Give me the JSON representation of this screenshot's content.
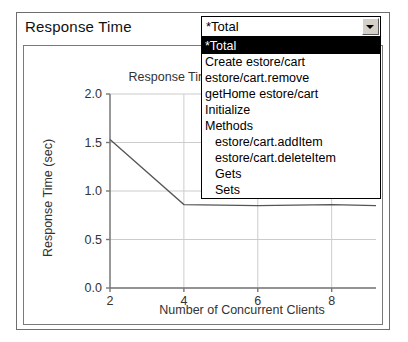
{
  "panel": {
    "title": "Response Time"
  },
  "combo": {
    "value": "*Total",
    "arrow_icon": "chevron-down-icon",
    "options": [
      {
        "label": "*Total",
        "selected": true,
        "indent": false
      },
      {
        "label": "Create estore/cart",
        "selected": false,
        "indent": false
      },
      {
        "label": "estore/cart.remove",
        "selected": false,
        "indent": false
      },
      {
        "label": "getHome estore/cart",
        "selected": false,
        "indent": false
      },
      {
        "label": "Initialize",
        "selected": false,
        "indent": false
      },
      {
        "label": "Methods",
        "selected": false,
        "indent": false
      },
      {
        "label": "estore/cart.addItem",
        "selected": false,
        "indent": true
      },
      {
        "label": "estore/cart.deleteItem",
        "selected": false,
        "indent": true
      },
      {
        "label": "Gets",
        "selected": false,
        "indent": true
      },
      {
        "label": "Sets",
        "selected": false,
        "indent": true
      }
    ]
  },
  "chart_data": {
    "type": "line",
    "title": "Response Time",
    "xlabel": "Number of Concurrent Clients",
    "ylabel": "Response Time (sec)",
    "xlim": [
      2,
      9.2
    ],
    "ylim": [
      0.0,
      2.0
    ],
    "xticks": [
      "2",
      "4",
      "6",
      "8"
    ],
    "xtick_values": [
      2,
      4,
      6,
      8
    ],
    "yticks": [
      "0.0",
      "0.5",
      "1.0",
      "1.5",
      "2.0"
    ],
    "ytick_values": [
      0.0,
      0.5,
      1.0,
      1.5,
      2.0
    ],
    "grid": true,
    "legend": "none",
    "line_color": "#555555",
    "series": [
      {
        "name": "*Total",
        "x": [
          2,
          4,
          6,
          8,
          9.2
        ],
        "values": [
          1.53,
          0.86,
          0.85,
          0.86,
          0.85
        ]
      }
    ]
  }
}
